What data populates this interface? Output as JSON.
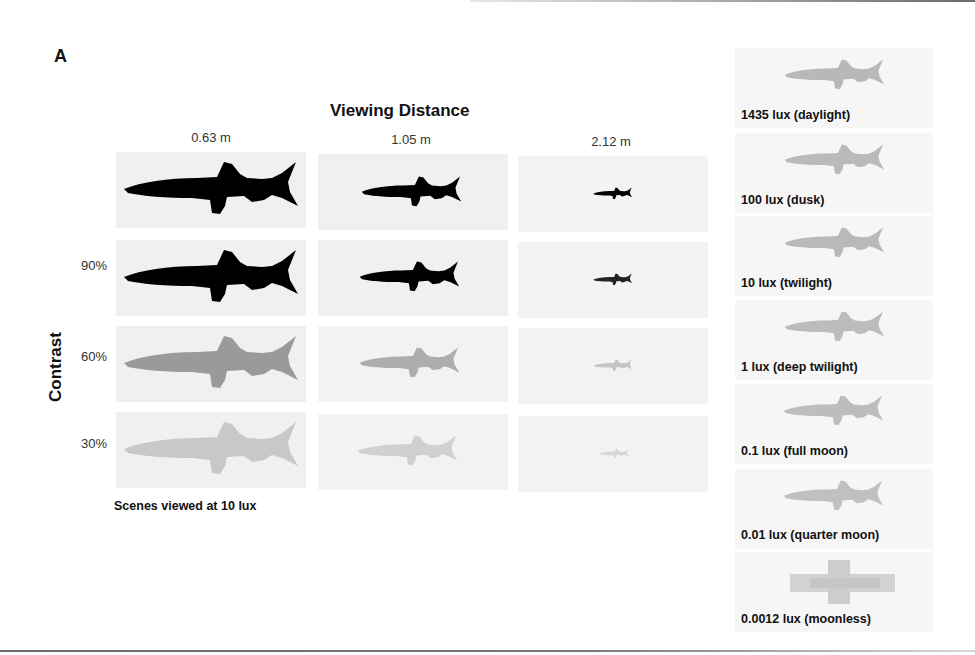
{
  "figure": {
    "panel_a": {
      "label": "A",
      "title": "Viewing Distance",
      "y_axis_label": "Contrast",
      "columns": [
        "0.63 m",
        "1.05 m",
        "2.12 m"
      ],
      "rows": [
        "",
        "90%",
        "60%",
        "30%"
      ],
      "caption": "Scenes viewed at 10 lux",
      "cell_fill": [
        "#000000",
        "#000000",
        "#9a9a9a",
        "#c6c6c6"
      ],
      "fish_scale": [
        1.0,
        0.58,
        0.22
      ]
    },
    "panel_b": {
      "label": "B",
      "conditions": [
        {
          "label": "1435 lux (daylight)",
          "fill": "#b8b8b8"
        },
        {
          "label": "100 lux (dusk)",
          "fill": "#bababa"
        },
        {
          "label": "10 lux (twilight)",
          "fill": "#b9b9b9"
        },
        {
          "label": "1 lux (deep twilight)",
          "fill": "#bcbcbc"
        },
        {
          "label": "0.1 lux (full moon)",
          "fill": "#bdbdbd"
        },
        {
          "label": "0.01 lux (quarter moon)",
          "fill": "#c0c0c0"
        },
        {
          "label": "0.0012 lux (moonless)",
          "fill": "#c8c8c8"
        }
      ]
    }
  }
}
